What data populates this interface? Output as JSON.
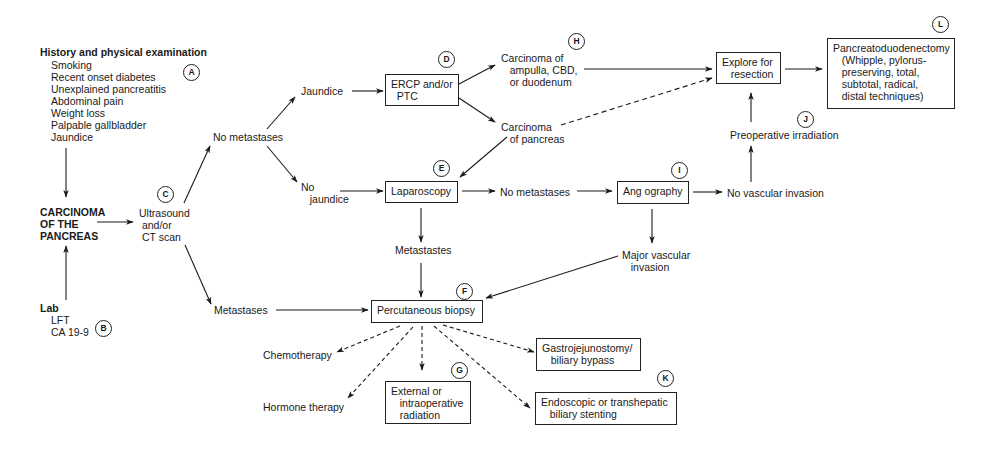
{
  "diagram": {
    "type": "flowchart",
    "topic": "Carcinoma of the pancreas management algorithm",
    "nodes": {
      "history": {
        "title": "History and physical examination",
        "items": [
          "Smoking",
          "Recent onset diabetes",
          "Unexplained pancreatitis",
          "Abdominal pain",
          "Weight loss",
          "Palpable gallbladder",
          "Jaundice"
        ],
        "badge": "A"
      },
      "lab": {
        "title": "Lab",
        "items": [
          "LFT",
          "CA 19-9"
        ],
        "badge": "B"
      },
      "carcinoma": {
        "label": "CARCINOMA\nOF THE\nPANCREAS"
      },
      "ultrasound": {
        "label": "Ultrasound\n and/or\n CT scan",
        "badge": "C"
      },
      "no_metastases_1": {
        "label": "No metastases"
      },
      "metastases_1": {
        "label": "Metastases"
      },
      "jaundice": {
        "label": "Jaundice"
      },
      "no_jaundice": {
        "label": "No\n   jaundice"
      },
      "ercp": {
        "label": "ERCP and/or\n  PTC",
        "badge": "D"
      },
      "carcinoma_ampulla": {
        "label": "Carcinoma of\n   ampulla, CBD,\n   or duodenum",
        "badge": "H"
      },
      "carcinoma_pancreas": {
        "label": "Carcinoma\n   of pancreas"
      },
      "laparoscopy": {
        "label": "Laparoscopy",
        "badge": "E"
      },
      "no_metastases_2": {
        "label": "No metastases"
      },
      "metastases_2": {
        "label": "Metastastes"
      },
      "angiography": {
        "label": "Ang ography",
        "badge": "I"
      },
      "no_vascular": {
        "label": "No vascular invasion"
      },
      "major_vascular": {
        "label": "Major vascular\n   invasion"
      },
      "preop_irradiation": {
        "label": "Preoperative irradiation",
        "badge": "J"
      },
      "explore": {
        "label": "Explore for\n   resection"
      },
      "pancreatoduodenectomy": {
        "label": "Pancreatoduodenectomy\n   (Whipple, pylorus-\n   preserving, total,\n   subtotal, radical,\n   distal techniques)",
        "badge": "L"
      },
      "percutaneous_biopsy": {
        "label": "Percutaneous biopsy",
        "badge": "F"
      },
      "chemotherapy": {
        "label": "Chemotherapy"
      },
      "hormone_therapy": {
        "label": "Hormone therapy"
      },
      "radiation": {
        "label": "External or\n   intraoperative\n   radiation",
        "badge": "G"
      },
      "gastrojejunostomy": {
        "label": "Gastrojejunostomy/\n   biliary bypass"
      },
      "stenting": {
        "label": "Endoscopic or transhepatic\n   biliary stenting",
        "badge": "K"
      }
    },
    "edges": [
      {
        "from": "history",
        "to": "carcinoma",
        "style": "solid"
      },
      {
        "from": "lab",
        "to": "carcinoma",
        "style": "solid"
      },
      {
        "from": "carcinoma",
        "to": "ultrasound",
        "style": "solid"
      },
      {
        "from": "ultrasound",
        "to": "no_metastases_1",
        "style": "solid"
      },
      {
        "from": "ultrasound",
        "to": "metastases_1",
        "style": "solid"
      },
      {
        "from": "no_metastases_1",
        "to": "jaundice",
        "style": "solid"
      },
      {
        "from": "no_metastases_1",
        "to": "no_jaundice",
        "style": "solid"
      },
      {
        "from": "jaundice",
        "to": "ercp",
        "style": "solid"
      },
      {
        "from": "ercp",
        "to": "carcinoma_ampulla",
        "style": "solid"
      },
      {
        "from": "ercp",
        "to": "carcinoma_pancreas",
        "style": "solid"
      },
      {
        "from": "carcinoma_ampulla",
        "to": "explore",
        "style": "solid"
      },
      {
        "from": "carcinoma_pancreas",
        "to": "explore",
        "style": "dashed"
      },
      {
        "from": "carcinoma_pancreas",
        "to": "laparoscopy",
        "style": "solid"
      },
      {
        "from": "no_jaundice",
        "to": "laparoscopy",
        "style": "solid"
      },
      {
        "from": "laparoscopy",
        "to": "no_metastases_2",
        "style": "solid"
      },
      {
        "from": "laparoscopy",
        "to": "metastases_2",
        "style": "solid"
      },
      {
        "from": "no_metastases_2",
        "to": "angiography",
        "style": "solid"
      },
      {
        "from": "angiography",
        "to": "no_vascular",
        "style": "solid"
      },
      {
        "from": "angiography",
        "to": "major_vascular",
        "style": "solid"
      },
      {
        "from": "no_vascular",
        "to": "preop_irradiation",
        "style": "solid"
      },
      {
        "from": "preop_irradiation",
        "to": "explore",
        "style": "solid"
      },
      {
        "from": "explore",
        "to": "pancreatoduodenectomy",
        "style": "solid"
      },
      {
        "from": "metastases_2",
        "to": "percutaneous_biopsy",
        "style": "solid"
      },
      {
        "from": "metastases_1",
        "to": "percutaneous_biopsy",
        "style": "solid"
      },
      {
        "from": "major_vascular",
        "to": "percutaneous_biopsy",
        "style": "solid"
      },
      {
        "from": "percutaneous_biopsy",
        "to": "chemotherapy",
        "style": "dashed"
      },
      {
        "from": "percutaneous_biopsy",
        "to": "hormone_therapy",
        "style": "dashed"
      },
      {
        "from": "percutaneous_biopsy",
        "to": "radiation",
        "style": "dashed"
      },
      {
        "from": "percutaneous_biopsy",
        "to": "gastrojejunostomy",
        "style": "dashed"
      },
      {
        "from": "percutaneous_biopsy",
        "to": "stenting",
        "style": "dashed"
      }
    ]
  }
}
